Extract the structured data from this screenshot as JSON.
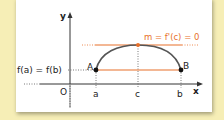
{
  "diagram": {
    "axes": {
      "x_label": "x",
      "y_label": "y",
      "origin_label": "O"
    },
    "ticks": {
      "a": "a",
      "c": "c",
      "b": "b"
    },
    "points": {
      "A": "A",
      "B": "B"
    },
    "labels": {
      "y_value": "f(a) = f(b)",
      "tangent": "m = f'(c) = 0"
    },
    "colors": {
      "background": "#f6eeb6",
      "card": "#ffffff",
      "curve": "#555555",
      "accent": "#e8702a",
      "axis": "#333333"
    }
  }
}
